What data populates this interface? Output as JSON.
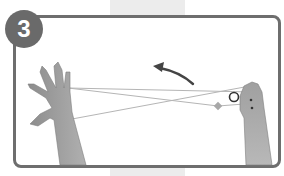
{
  "step": {
    "number": "3"
  },
  "illustration": {
    "description": "Left open hand and right closed fist holding a crossed string loop; curved arrow indicates counter-clockwise motion toward the left",
    "icons": [
      "open-hand",
      "fist-hand",
      "curved-arrow-left",
      "ring-marker",
      "diamond-marker"
    ]
  },
  "colors": {
    "frame": "#6e6e6e",
    "badge": "#6a6a6a",
    "band": "#ececec",
    "skin": "#9a9a9a",
    "string": "#b5b5b5"
  }
}
